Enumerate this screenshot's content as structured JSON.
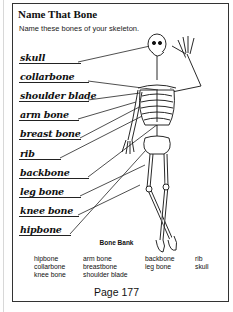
{
  "worksheet": {
    "title": "Name That Bone",
    "instructions": "Name these bones of your skeleton.",
    "answers": [
      {
        "label": "skull",
        "y": 52
      },
      {
        "label": "collarbone",
        "y": 71
      },
      {
        "label": "shoulder blade",
        "y": 90
      },
      {
        "label": "arm bone",
        "y": 109
      },
      {
        "label": "breast bone",
        "y": 128
      },
      {
        "label": "rib",
        "y": 148
      },
      {
        "label": "backbone",
        "y": 167
      },
      {
        "label": "leg bone",
        "y": 186
      },
      {
        "label": "knee bone",
        "y": 205
      },
      {
        "label": "hipbone",
        "y": 224
      }
    ],
    "bone_bank": {
      "title": "Bone Bank",
      "columns": [
        [
          "hipbone",
          "collarbone",
          "knee bone"
        ],
        [
          "arm bone",
          "breastbone",
          "shoulder blade"
        ],
        [
          "backbone",
          "leg bone"
        ],
        [
          "rib",
          "skull"
        ]
      ]
    },
    "page_label": "Page 177"
  },
  "colors": {
    "ink": "#111111",
    "frame": "#333333",
    "background": "#ffffff"
  }
}
